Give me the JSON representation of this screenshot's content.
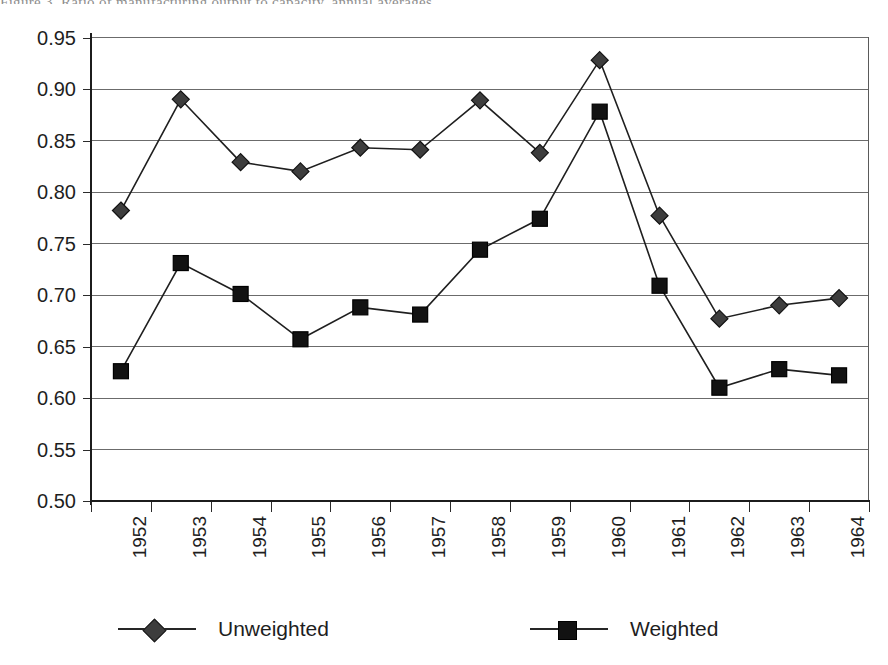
{
  "figure": {
    "caption_remnant": "Figure 3.  Ratio of manufacturing output to capacity, annual averages"
  },
  "chart_data": {
    "type": "line",
    "title": "",
    "xlabel": "",
    "ylabel": "",
    "categories": [
      "1952",
      "1953",
      "1954",
      "1955",
      "1956",
      "1957",
      "1958",
      "1959",
      "1960",
      "1961",
      "1962",
      "1963",
      "1964"
    ],
    "ylim": [
      0.5,
      0.95
    ],
    "yticks": [
      "0.95",
      "0.90",
      "0.85",
      "0.80",
      "0.75",
      "0.70",
      "0.65",
      "0.60",
      "0.55",
      "0.50"
    ],
    "ytick_values": [
      0.95,
      0.9,
      0.85,
      0.8,
      0.75,
      0.7,
      0.65,
      0.6,
      0.55,
      0.5
    ],
    "grid": true,
    "legend_position": "bottom",
    "series": [
      {
        "name": "Unweighted",
        "marker": "diamond",
        "color": "#3d3d3d",
        "values": [
          0.782,
          0.89,
          0.829,
          0.82,
          0.843,
          0.841,
          0.889,
          0.838,
          0.928,
          0.777,
          0.677,
          0.69,
          0.697
        ]
      },
      {
        "name": "Weighted",
        "marker": "square",
        "color": "#121212",
        "values": [
          0.626,
          0.731,
          0.701,
          0.657,
          0.688,
          0.681,
          0.744,
          0.774,
          0.878,
          0.709,
          0.61,
          0.628,
          0.622
        ]
      }
    ]
  },
  "legend": {
    "entries": [
      {
        "label": "Unweighted",
        "marker": "diamond"
      },
      {
        "label": "Weighted",
        "marker": "square"
      }
    ]
  }
}
